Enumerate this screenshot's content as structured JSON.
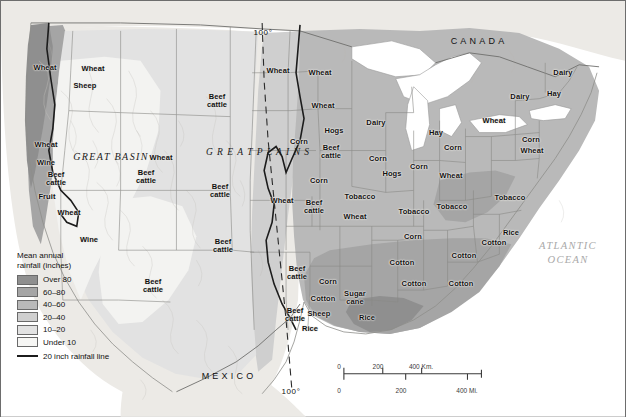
{
  "map": {
    "title": "Agricultural regions and mean annual rainfall of the United States",
    "countries": [
      {
        "name": "CANADA",
        "x": 478,
        "y": 40
      },
      {
        "name": "MEXICO",
        "x": 228,
        "y": 375
      }
    ],
    "oceans": [
      {
        "name": "ATLANTIC\nOCEAN",
        "x": 567,
        "y": 252
      },
      {
        "name": "Gulf of Mexico",
        "x": 404,
        "y": 349
      }
    ],
    "regions": [
      {
        "name": "GREAT BASIN",
        "x": 110,
        "y": 155
      }
    ],
    "plains_label": {
      "name": "G\nR\nE\nA\nT\n \nP\nL\nA\nI\nN\nS",
      "x": 257,
      "y": 152
    },
    "meridian": {
      "label": "100°",
      "top_x": 262,
      "top_y": 31,
      "bottom_x": 290,
      "bottom_y": 390
    },
    "crops": [
      {
        "label": "Wheat",
        "x": 44,
        "y": 67
      },
      {
        "label": "Sheep",
        "x": 84,
        "y": 85
      },
      {
        "label": "Wheat",
        "x": 92,
        "y": 68
      },
      {
        "label": "Wheat",
        "x": 45,
        "y": 144
      },
      {
        "label": "Wine",
        "x": 45,
        "y": 162
      },
      {
        "label": "Beef\ncattle",
        "x": 55,
        "y": 178
      },
      {
        "label": "Fruit",
        "x": 46,
        "y": 196
      },
      {
        "label": "Wheat",
        "x": 68,
        "y": 212
      },
      {
        "label": "Wine",
        "x": 88,
        "y": 239
      },
      {
        "label": "Beef\ncattle",
        "x": 145,
        "y": 176
      },
      {
        "label": "Wheat",
        "x": 160,
        "y": 157
      },
      {
        "label": "Beef\ncattle",
        "x": 152,
        "y": 285
      },
      {
        "label": "Beef\ncattle",
        "x": 219,
        "y": 190
      },
      {
        "label": "Beef\ncattle",
        "x": 216,
        "y": 100
      },
      {
        "label": "Beef\ncattle",
        "x": 222,
        "y": 245
      },
      {
        "label": "Wheat",
        "x": 277,
        "y": 70
      },
      {
        "label": "Wheat",
        "x": 319,
        "y": 72
      },
      {
        "label": "Wheat",
        "x": 322,
        "y": 105
      },
      {
        "label": "Wheat",
        "x": 281,
        "y": 200
      },
      {
        "label": "Hogs",
        "x": 333,
        "y": 130
      },
      {
        "label": "Corn",
        "x": 298,
        "y": 141
      },
      {
        "label": "Beef\ncattle",
        "x": 330,
        "y": 151
      },
      {
        "label": "Corn",
        "x": 318,
        "y": 180
      },
      {
        "label": "Beef\ncattle",
        "x": 313,
        "y": 206
      },
      {
        "label": "Dairy",
        "x": 375,
        "y": 122
      },
      {
        "label": "Corn",
        "x": 377,
        "y": 158
      },
      {
        "label": "Hogs",
        "x": 391,
        "y": 173
      },
      {
        "label": "Wheat",
        "x": 354,
        "y": 216
      },
      {
        "label": "Tobacco",
        "x": 359,
        "y": 196
      },
      {
        "label": "Hay",
        "x": 435,
        "y": 132
      },
      {
        "label": "Corn",
        "x": 418,
        "y": 166
      },
      {
        "label": "Corn",
        "x": 452,
        "y": 147
      },
      {
        "label": "Wheat",
        "x": 450,
        "y": 175
      },
      {
        "label": "Tobacco",
        "x": 413,
        "y": 211
      },
      {
        "label": "Tobacco",
        "x": 451,
        "y": 206
      },
      {
        "label": "Tobacco",
        "x": 509,
        "y": 197
      },
      {
        "label": "Wheat",
        "x": 493,
        "y": 120
      },
      {
        "label": "Corn",
        "x": 530,
        "y": 139
      },
      {
        "label": "Wheat",
        "x": 531,
        "y": 150
      },
      {
        "label": "Dairy",
        "x": 519,
        "y": 96
      },
      {
        "label": "Dairy",
        "x": 562,
        "y": 72
      },
      {
        "label": "Hay",
        "x": 553,
        "y": 93
      },
      {
        "label": "Corn",
        "x": 412,
        "y": 236
      },
      {
        "label": "Cotton",
        "x": 493,
        "y": 242
      },
      {
        "label": "Rice",
        "x": 510,
        "y": 232
      },
      {
        "label": "Cotton",
        "x": 401,
        "y": 262
      },
      {
        "label": "Cotton",
        "x": 413,
        "y": 283
      },
      {
        "label": "Cotton",
        "x": 460,
        "y": 283
      },
      {
        "label": "Cotton",
        "x": 463,
        "y": 255
      },
      {
        "label": "Beef\ncattle",
        "x": 296,
        "y": 272
      },
      {
        "label": "Corn",
        "x": 327,
        "y": 281
      },
      {
        "label": "Cotton",
        "x": 322,
        "y": 298
      },
      {
        "label": "Sheep",
        "x": 318,
        "y": 313
      },
      {
        "label": "Rice",
        "x": 309,
        "y": 328
      },
      {
        "label": "Beef\ncattle",
        "x": 294,
        "y": 314
      },
      {
        "label": "Sugar\ncane",
        "x": 354,
        "y": 297
      },
      {
        "label": "Rice",
        "x": 366,
        "y": 317
      }
    ]
  },
  "legend": {
    "title": "Mean annual\nrainfall (inches)",
    "classes": [
      {
        "label": "Over 80",
        "color": "#8f8f8f"
      },
      {
        "label": "60–80",
        "color": "#a5a5a5"
      },
      {
        "label": "40–60",
        "color": "#b9b9b9"
      },
      {
        "label": "20–40",
        "color": "#cfcfcf"
      },
      {
        "label": "10–20",
        "color": "#e2e2e2"
      },
      {
        "label": "Under 10",
        "color": "#f6f6f4"
      }
    ],
    "rain_line_label": "20 inch rainfall line",
    "rain_line_color": "#1c1c1c"
  },
  "scalebar": {
    "km": {
      "unit": "Km.",
      "ticks": [
        "0",
        "200",
        "400 Km."
      ]
    },
    "mi": {
      "unit": "Mi.",
      "ticks": [
        "0",
        "200",
        "400 Mi."
      ]
    }
  }
}
